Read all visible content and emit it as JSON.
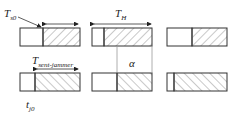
{
  "diagram": {
    "type": "timing-diagram",
    "labels": {
      "t_s0": {
        "main": "T",
        "sub": "s0"
      },
      "t_h": {
        "main": "T",
        "sub": "H"
      },
      "t_sent_jammer": {
        "main": "T",
        "sub": "sent-jammer"
      },
      "alpha": "α",
      "t_j0": {
        "main": "t",
        "sub": "j0"
      }
    },
    "rows": [
      {
        "name": "top-row",
        "blocks": [
          {
            "clear_fraction": 0.38,
            "hatch": "forward"
          },
          {
            "clear_fraction": 0.38,
            "hatch": "forward"
          },
          {
            "clear_fraction": 0.45,
            "hatch": "forward"
          }
        ]
      },
      {
        "name": "bottom-row",
        "blocks": [
          {
            "clear_fraction": 0.38,
            "hatch": "backward"
          },
          {
            "clear_fraction": 0.45,
            "hatch": "backward"
          },
          {
            "clear_fraction": 0.15,
            "hatch": "backward"
          }
        ]
      }
    ],
    "colors": {
      "stroke": "#333333",
      "hatch": "#777777",
      "guide": "#999999"
    }
  }
}
